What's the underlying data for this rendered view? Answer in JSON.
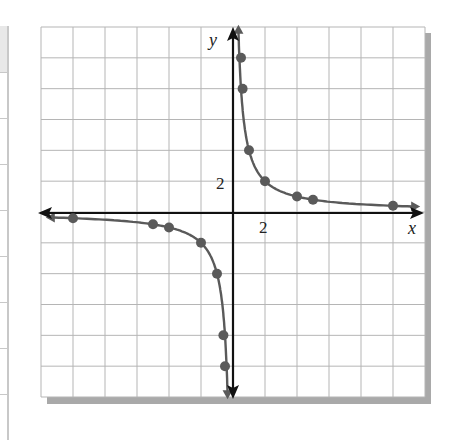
{
  "chart_data": {
    "type": "line",
    "title": "",
    "xlabel": "x",
    "ylabel": "y",
    "xlim": [
      -12,
      12
    ],
    "ylim": [
      -12,
      12
    ],
    "grid": true,
    "grid_step": 2,
    "tick_labels": {
      "x": [
        "2"
      ],
      "y": [
        "2"
      ]
    },
    "function": "y = 4/x",
    "series": [
      {
        "name": "right branch",
        "points": [
          [
            0.5,
            10
          ],
          [
            0.6,
            8
          ],
          [
            1,
            4
          ],
          [
            2,
            2
          ],
          [
            4,
            1
          ],
          [
            5,
            0.8
          ],
          [
            10,
            0.4
          ]
        ]
      },
      {
        "name": "left branch",
        "points": [
          [
            -10,
            -0.4
          ],
          [
            -5,
            -0.8
          ],
          [
            -4,
            -1
          ],
          [
            -2,
            -2
          ],
          [
            -1,
            -4
          ],
          [
            -0.6,
            -8
          ],
          [
            -0.5,
            -10
          ]
        ]
      }
    ],
    "colors": {
      "curve": "#5a5a5a",
      "axes": "#111111",
      "grid": "#b5b5b5",
      "shadow": "#a9a9a9"
    }
  },
  "labels": {
    "x_axis": "x",
    "y_axis": "y",
    "x_tick": "2",
    "y_tick": "2"
  }
}
